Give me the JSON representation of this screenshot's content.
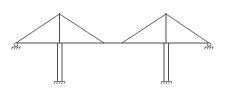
{
  "diagram": {
    "towers": [
      {
        "id": "left-tower"
      },
      {
        "id": "right-tower"
      }
    ],
    "cables_per_tower": 2,
    "supports": {
      "deck_ends": "pinned",
      "pier_bases": "fixed"
    },
    "colors": {
      "line": "#3a3a3a",
      "background": "#ffffff"
    }
  }
}
